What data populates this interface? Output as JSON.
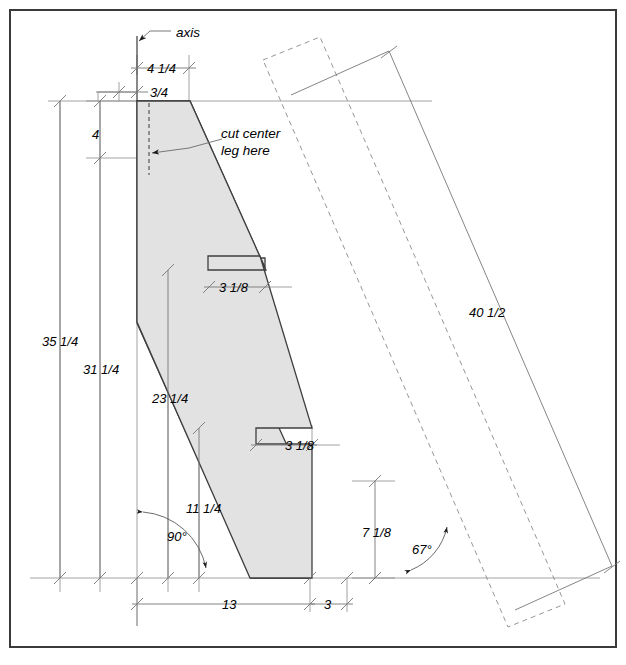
{
  "drawing": {
    "title": "Angled leg cut layout drawing",
    "background_color": "#ffffff",
    "frame_color": "#3a3a3a",
    "part_fill_color": "#e0e0e0",
    "line_color": "#555555",
    "outline_color": "#3a3a3a"
  },
  "labels": {
    "axis": "axis",
    "note_cut": "cut center\nleg here",
    "note_cut_line1": "cut center",
    "note_cut_line2": "leg here"
  },
  "dimensions": {
    "top_width_outer": "4 1/4",
    "top_width_inner": "3/4",
    "top_drop": "4",
    "left_outer_height": "35 1/4",
    "left_inner_height": "31 1/4",
    "mid_height": "23 1/4",
    "lower_height": "11 1/4",
    "notch_upper": "3 1/8",
    "notch_lower": "3 1/8",
    "right_height": "7 1/8",
    "diagonal_length": "40 1/2",
    "bottom_long": "13",
    "bottom_short": "3",
    "angle_left": "90°",
    "angle_right": "67°"
  }
}
